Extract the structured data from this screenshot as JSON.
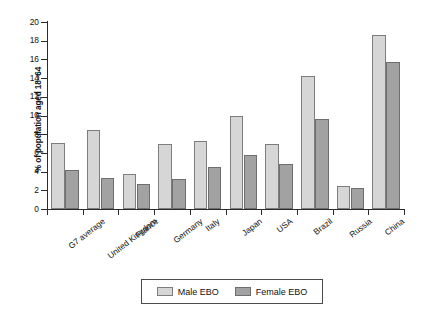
{
  "chart_data": {
    "type": "bar",
    "title": "",
    "subtitle": "",
    "xlabel": "",
    "ylabel": "% of population aged 18–64",
    "ylim": [
      0,
      20
    ],
    "ytick_step": 2,
    "yticks": [
      20,
      18,
      16,
      14,
      12,
      10,
      8,
      6,
      4,
      2,
      0
    ],
    "grid": false,
    "legend_position": "bottom-center",
    "categories": [
      "G7 average",
      "United Kingdom",
      "France",
      "Germany",
      "Italy",
      "Japan",
      "USA",
      "Brazil",
      "Russia",
      "China"
    ],
    "series": [
      {
        "name": "Male EBO",
        "color": "#d6d6d6",
        "values": [
          7.1,
          8.4,
          3.7,
          6.95,
          7.25,
          9.9,
          6.95,
          14.2,
          2.45,
          18.6
        ]
      },
      {
        "name": "Female EBO",
        "color": "#a2a2a2",
        "values": [
          4.15,
          3.3,
          2.65,
          3.25,
          4.45,
          5.8,
          4.8,
          9.65,
          2.25,
          15.75
        ]
      }
    ]
  },
  "legend": {
    "entries": [
      {
        "label": "Male EBO",
        "swatch": "male"
      },
      {
        "label": "Female EBO",
        "swatch": "female"
      }
    ]
  },
  "colors": {
    "male_bar": "#d6d6d6",
    "female_bar": "#a2a2a2",
    "axis": "#2b2b2b",
    "background": "#ffffff"
  }
}
